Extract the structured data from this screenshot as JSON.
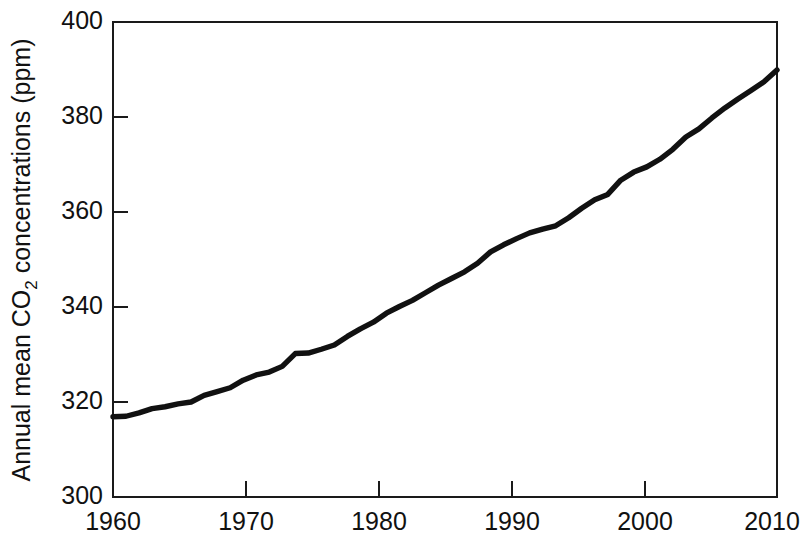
{
  "chart_data": {
    "type": "line",
    "title": "",
    "xlabel": "",
    "ylabel": "Annual mean CO2 concentrations (ppm)",
    "ylabel_parts": {
      "before": "Annual mean CO",
      "subscript": "2",
      "after": " concentrations (ppm)"
    },
    "xlim": [
      1959,
      2010
    ],
    "ylim": [
      300,
      400
    ],
    "xticks": [
      1960,
      1970,
      1980,
      1990,
      2000,
      2010
    ],
    "yticks": [
      300,
      320,
      340,
      360,
      380,
      400
    ],
    "xtick_labels": [
      "1960",
      "1970",
      "1980",
      "1990",
      "2000",
      "2010"
    ],
    "ytick_labels": [
      "300",
      "320",
      "340",
      "360",
      "380",
      "400"
    ],
    "grid": false,
    "legend": "none",
    "line_color": "#111111",
    "axis_color": "#1a1a1a",
    "background_color": "#ffffff",
    "series": [
      {
        "name": "Annual mean CO2 concentration",
        "x": [
          1959,
          1960,
          1961,
          1962,
          1963,
          1964,
          1965,
          1966,
          1967,
          1968,
          1969,
          1970,
          1971,
          1972,
          1973,
          1974,
          1975,
          1976,
          1977,
          1978,
          1979,
          1980,
          1981,
          1982,
          1983,
          1984,
          1985,
          1986,
          1987,
          1988,
          1989,
          1990,
          1991,
          1992,
          1993,
          1994,
          1995,
          1996,
          1997,
          1998,
          1999,
          2000,
          2001,
          2002,
          2003,
          2004,
          2005,
          2006,
          2007,
          2008,
          2009,
          2010
        ],
        "values": [
          316.9,
          317.0,
          317.7,
          318.6,
          319.0,
          319.6,
          320.0,
          321.4,
          322.2,
          323.0,
          324.6,
          325.7,
          326.3,
          327.5,
          330.2,
          330.3,
          331.1,
          332.0,
          333.8,
          335.4,
          336.8,
          338.7,
          340.1,
          341.4,
          343.0,
          344.6,
          346.0,
          347.4,
          349.2,
          351.6,
          353.1,
          354.4,
          355.6,
          356.4,
          357.1,
          358.8,
          360.8,
          362.6,
          363.7,
          366.7,
          368.4,
          369.5,
          371.1,
          373.2,
          375.8,
          377.5,
          379.8,
          381.9,
          383.8,
          385.6,
          387.4,
          389.9
        ]
      }
    ]
  },
  "figure": {
    "canvas_label": "co2-concentration-line-chart"
  }
}
